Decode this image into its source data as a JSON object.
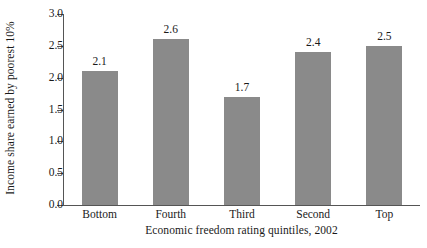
{
  "chart_data": {
    "type": "bar",
    "title": "",
    "subtitle": "",
    "categories": [
      "Bottom",
      "Fourth",
      "Third",
      "Second",
      "Top"
    ],
    "values": [
      2.1,
      2.6,
      1.7,
      2.4,
      2.5
    ],
    "value_labels": [
      "2.1",
      "2.6",
      "1.7",
      "2.4",
      "2.5"
    ],
    "xlabel": "Economic freedom rating quintiles, 2002",
    "ylabel": "Income share earned by poorest 10%",
    "ylim": [
      0.0,
      3.0
    ],
    "ytick_values": [
      0.0,
      0.5,
      1.0,
      1.5,
      2.0,
      2.5,
      3.0
    ],
    "ytick_labels": [
      "0.0",
      "0.5",
      "1.0",
      "1.5",
      "2.0",
      "2.5",
      "3.0"
    ],
    "grid": false,
    "legend": null,
    "legend_position": "none",
    "annotations": [],
    "colors": {
      "bar": "#8a8a8a",
      "axis": "#555555",
      "text": "#1a1a1a",
      "background": "#ffffff"
    }
  }
}
